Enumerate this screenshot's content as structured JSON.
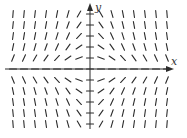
{
  "figure": {
    "type": "slope-field",
    "x_axis_label": "x",
    "y_axis_label": "y",
    "color": "#2b2b2b",
    "origin_px": [
      90,
      69
    ],
    "unit_px": [
      11,
      11
    ],
    "x_range": [
      -7,
      7
    ],
    "y_range": [
      -5,
      5
    ],
    "segment_length_px": 7,
    "slope_rule": "dy/dx = -x*y (scaled)",
    "slope_scale": 0.35
  }
}
